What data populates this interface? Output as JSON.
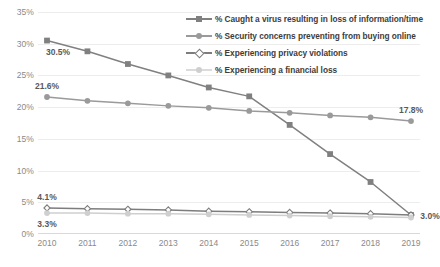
{
  "chart_data": {
    "type": "line",
    "title": "",
    "xlabel": "",
    "ylabel": "",
    "categories": [
      "2010",
      "2011",
      "2012",
      "2013",
      "2014",
      "2015",
      "2016",
      "2017",
      "2018",
      "2019"
    ],
    "ylim": [
      0,
      35
    ],
    "ytick_labels": [
      "0%",
      "5%",
      "10%",
      "15%",
      "20%",
      "25%",
      "30%",
      "35%"
    ],
    "ytick_values": [
      0,
      5,
      10,
      15,
      20,
      25,
      30,
      35
    ],
    "grid": true,
    "legend_position": "top-right",
    "series": [
      {
        "name": "% Caught a virus resulting in loss of information/time",
        "color": "#808080",
        "marker": "square",
        "values": [
          30.5,
          28.8,
          26.8,
          25.0,
          23.1,
          21.7,
          17.2,
          12.6,
          8.2,
          3.0
        ]
      },
      {
        "name": "% Security concerns preventing from buying online",
        "color": "#9a9a9a",
        "marker": "circle",
        "values": [
          21.6,
          21.0,
          20.6,
          20.2,
          19.9,
          19.4,
          19.1,
          18.7,
          18.4,
          17.8
        ]
      },
      {
        "name": "% Experiencing  privacy violations",
        "color": "#7d7d7d",
        "marker": "diamond-open",
        "values": [
          4.1,
          4.0,
          3.9,
          3.8,
          3.6,
          3.5,
          3.4,
          3.3,
          3.2,
          3.0
        ]
      },
      {
        "name": "% Experiencing a financial loss",
        "color": "#cfcfcf",
        "marker": "circle",
        "values": [
          3.3,
          3.3,
          3.2,
          3.2,
          3.1,
          3.0,
          2.9,
          2.8,
          2.7,
          2.6
        ]
      }
    ],
    "data_labels": [
      {
        "text": "30.5%",
        "series": 0,
        "index": 0,
        "position": "below-right"
      },
      {
        "text": "21.6%",
        "series": 1,
        "index": 0,
        "position": "above"
      },
      {
        "text": "4.1%",
        "series": 2,
        "index": 0,
        "position": "above"
      },
      {
        "text": "3.3%",
        "series": 3,
        "index": 0,
        "position": "below"
      },
      {
        "text": "17.8%",
        "series": 1,
        "index": 9,
        "position": "above"
      },
      {
        "text": "3.0%",
        "series": 0,
        "index": 9,
        "position": "right"
      }
    ]
  }
}
